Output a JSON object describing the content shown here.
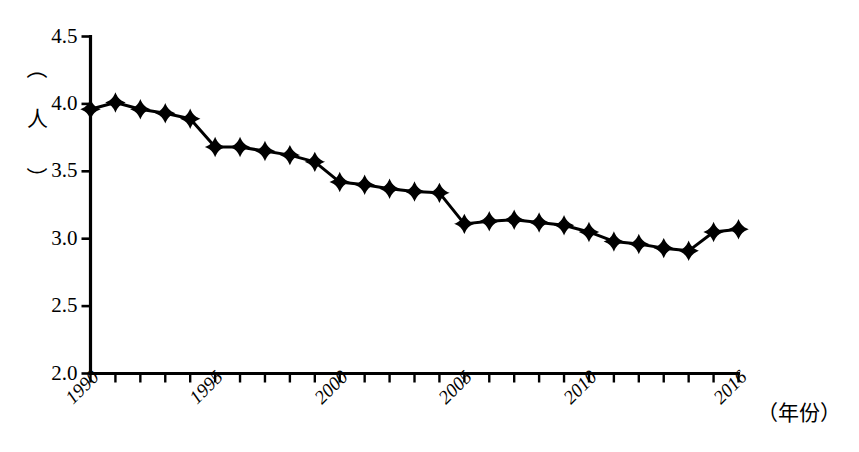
{
  "chart_data": {
    "type": "line",
    "title": "",
    "subtitle": "",
    "xlabel": "（年份）",
    "ylabel": "（人）",
    "x": [
      1990,
      1991,
      1992,
      1993,
      1994,
      1995,
      1996,
      1997,
      1998,
      1999,
      2000,
      2001,
      2002,
      2003,
      2004,
      2005,
      2006,
      2007,
      2008,
      2009,
      2010,
      2011,
      2012,
      2013,
      2014,
      2015,
      2016
    ],
    "values": [
      3.96,
      4.01,
      3.96,
      3.93,
      3.89,
      3.68,
      3.68,
      3.65,
      3.62,
      3.57,
      3.42,
      3.4,
      3.37,
      3.35,
      3.34,
      3.11,
      3.13,
      3.14,
      3.12,
      3.1,
      3.05,
      2.98,
      2.96,
      2.93,
      2.91,
      3.05,
      3.07
    ],
    "series": [
      {
        "name": "户均人口",
        "values": [
          3.96,
          4.01,
          3.96,
          3.93,
          3.89,
          3.68,
          3.68,
          3.65,
          3.62,
          3.57,
          3.42,
          3.4,
          3.37,
          3.35,
          3.34,
          3.11,
          3.13,
          3.14,
          3.12,
          3.1,
          3.05,
          2.98,
          2.96,
          2.93,
          2.91,
          3.05,
          3.07
        ]
      }
    ],
    "xlim": [
      1990,
      2016
    ],
    "ylim": [
      2.0,
      4.5
    ],
    "yticks": [
      2.0,
      2.5,
      3.0,
      3.5,
      4.0,
      4.5
    ],
    "ytick_labels": [
      "2.0",
      "2.5",
      "3.0",
      "3.5",
      "4.0",
      "4.5"
    ],
    "xtick_labels": [
      "1990",
      "1995",
      "2000",
      "2005",
      "2010",
      "2016"
    ],
    "xtick_values": [
      1990,
      1995,
      2000,
      2005,
      2010,
      2016
    ],
    "grid": false,
    "legend": false,
    "legend_position": "none",
    "marker": "diamond",
    "line_color": "#000000",
    "marker_color": "#000000",
    "background_color": "#ffffff",
    "annotations": []
  },
  "axis_unit": {
    "y_paren_open": "（",
    "y_char": "人",
    "y_paren_close": "）"
  }
}
